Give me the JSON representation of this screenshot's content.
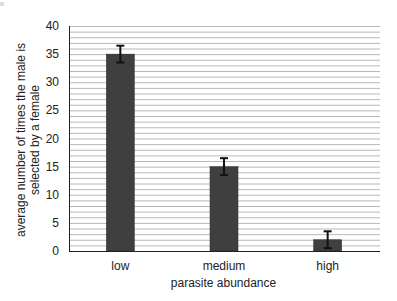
{
  "chart_data": {
    "type": "bar",
    "title": "",
    "categories": [
      "low",
      "medium",
      "high"
    ],
    "values": [
      35,
      15,
      2
    ],
    "error_bars": {
      "upper": [
        36.5,
        16.5,
        3.5
      ],
      "lower": [
        33.5,
        13.5,
        0.5
      ]
    },
    "xlabel": "parasite abundance",
    "ylabel_lines": [
      "average number of times the male is",
      "selected by a female"
    ],
    "ylabel": "average number of times the male is selected by a female",
    "ylim": [
      0,
      40
    ],
    "yticks": [
      0,
      5,
      10,
      15,
      20,
      25,
      30,
      35,
      40
    ],
    "grid": true,
    "minor_grid_step": 1,
    "legend": null
  },
  "colors": {
    "bar": "#3f3f3f",
    "grid": "#b8b8b8",
    "axis": "#222222",
    "error_bar": "#111111"
  }
}
